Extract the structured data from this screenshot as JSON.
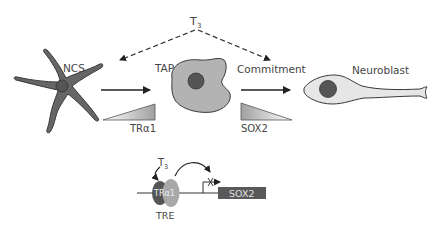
{
  "diagram": {
    "regulator": {
      "label": "T",
      "subscript": "3"
    },
    "stages": [
      {
        "id": "ncs",
        "label": "NCS"
      },
      {
        "id": "tap",
        "label": "TAP"
      },
      {
        "id": "commitment",
        "label": "Commitment"
      },
      {
        "id": "neuroblast",
        "label": "Neuroblast"
      }
    ],
    "gradients": [
      {
        "id": "tra1",
        "label": "TRα1",
        "direction": "increasing"
      },
      {
        "id": "sox2",
        "label": "SOX2",
        "direction": "decreasing"
      }
    ],
    "promoter": {
      "ligand": {
        "label": "T",
        "subscript": "3"
      },
      "receptor_label": "TRα1",
      "element_label": "TRE",
      "gene_label": "SOX2",
      "transcription_state": "repressed"
    },
    "colors": {
      "ncs_cell": "#666666",
      "ncs_nucleus": "#555555",
      "tap_cell": "#b3b3b3",
      "tap_nucleus": "#555555",
      "neuroblast_cell": "#e6e6e6",
      "neuroblast_nucleus": "#555555",
      "gene_box": "#595959",
      "receptor_dark": "#555555",
      "receptor_light": "#a8a8a8"
    }
  }
}
